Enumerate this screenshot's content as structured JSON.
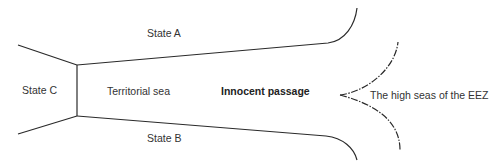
{
  "diagram": {
    "labels": {
      "state_a": "State A",
      "state_b": "State B",
      "state_c": "State C",
      "territorial_sea": "Territorial sea",
      "innocent_passage": "Innocent passage",
      "high_seas": "The high seas of the EEZ"
    },
    "colors": {
      "line": "#2a2a2a",
      "text": "#333333",
      "background": "#ffffff"
    }
  }
}
